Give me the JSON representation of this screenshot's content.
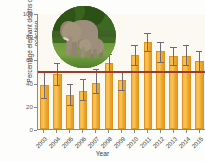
{
  "chart_data": {
    "type": "bar",
    "title": "",
    "xlabel": "Year",
    "ylabel": "Percentage elephant deaths due to poaching",
    "ylim": [
      0,
      100
    ],
    "yticks": [
      0,
      20,
      40,
      60,
      80,
      100
    ],
    "grid": false,
    "legend": "none",
    "categories": [
      "2003",
      "2004",
      "2005",
      "2006",
      "2007",
      "2008",
      "2009",
      "2010",
      "2011",
      "2012",
      "2013",
      "2014",
      "2015"
    ],
    "values": [
      38,
      47,
      29,
      33,
      40,
      57,
      42,
      64,
      75,
      67,
      63,
      63,
      59
    ],
    "error_low": [
      27,
      38,
      21,
      25,
      31,
      49,
      34,
      55,
      67,
      58,
      55,
      55,
      50
    ],
    "error_high": [
      49,
      57,
      39,
      43,
      52,
      65,
      50,
      72,
      83,
      75,
      71,
      72,
      67
    ],
    "series": [
      {
        "name": "Percentage elephant deaths due to poaching",
        "values": [
          38,
          47,
          29,
          33,
          40,
          57,
          42,
          64,
          75,
          67,
          63,
          63,
          59
        ]
      }
    ],
    "reference_line": {
      "value": 50,
      "color": "#9c3a2b",
      "label": ""
    },
    "bar_color": "#f2ab33",
    "error_bar_color": "#6e6b74"
  },
  "inset": {
    "name": "elephant-photo",
    "description": "Adult African elephant with calf on grassland"
  }
}
